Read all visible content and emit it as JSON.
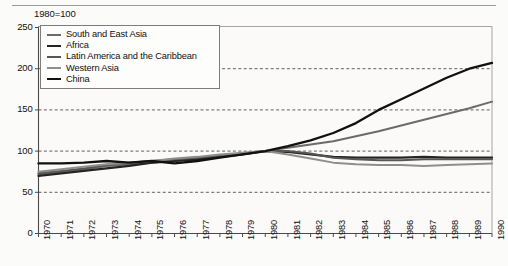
{
  "figure": {
    "caption": "1980=100",
    "top_rule": true
  },
  "chart_data": {
    "type": "line",
    "title": "",
    "subtitle": "1980=100",
    "xlabel": "",
    "ylabel": "",
    "grid": true,
    "legend_position": "top-left-inside",
    "xlim": [
      1970,
      1990
    ],
    "ylim": [
      0,
      250
    ],
    "yticks": [
      0,
      50,
      100,
      150,
      200,
      250
    ],
    "ytick_labels": [
      "0",
      "50",
      "100",
      "150",
      "200",
      "250"
    ],
    "gridlines": [
      50,
      100,
      150,
      200
    ],
    "categories": [
      "1970",
      "1971",
      "1972",
      "1973",
      "1974",
      "1975",
      "1976",
      "1977",
      "1978",
      "1979",
      "1980",
      "1981",
      "1982",
      "1983",
      "1984",
      "1985",
      "1986",
      "1987",
      "1988",
      "1989",
      "1990"
    ],
    "x": [
      1970,
      1971,
      1972,
      1973,
      1974,
      1975,
      1976,
      1977,
      1978,
      1979,
      1980,
      1981,
      1982,
      1983,
      1984,
      1985,
      1986,
      1987,
      1988,
      1989,
      1990
    ],
    "series": [
      {
        "name": "South and East Asia",
        "color": "#6b6b6b",
        "width": 2.0,
        "values": [
          72,
          75,
          78,
          82,
          84,
          86,
          88,
          91,
          94,
          97,
          100,
          104,
          108,
          112,
          118,
          124,
          131,
          138,
          145,
          152,
          160
        ]
      },
      {
        "name": "Africa",
        "color": "#242424",
        "width": 2.2,
        "values": [
          70,
          73,
          76,
          79,
          82,
          86,
          88,
          90,
          93,
          96,
          100,
          99,
          96,
          93,
          92,
          92,
          92,
          93,
          92,
          92,
          92
        ]
      },
      {
        "name": "Latin America and the Caribbean",
        "color": "#565656",
        "width": 2.0,
        "values": [
          73,
          76,
          79,
          83,
          86,
          88,
          90,
          92,
          95,
          97,
          100,
          100,
          97,
          92,
          90,
          89,
          89,
          90,
          90,
          90,
          90
        ]
      },
      {
        "name": "Western Asia",
        "color": "#8e8e8e",
        "width": 2.0,
        "values": [
          75,
          78,
          81,
          84,
          86,
          88,
          91,
          93,
          96,
          98,
          100,
          96,
          91,
          86,
          84,
          83,
          83,
          82,
          83,
          84,
          85
        ]
      },
      {
        "name": "China",
        "color": "#111111",
        "width": 2.3,
        "values": [
          85,
          85,
          86,
          88,
          86,
          88,
          85,
          88,
          92,
          96,
          100,
          106,
          113,
          122,
          134,
          150,
          163,
          176,
          189,
          200,
          207
        ]
      }
    ]
  }
}
